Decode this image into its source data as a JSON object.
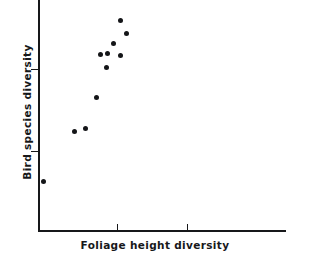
{
  "chart_data": {
    "type": "scatter",
    "title": "",
    "xlabel": "Foliage height diversity",
    "ylabel": "Bird species diversity",
    "grid": false,
    "legend": null,
    "xlim": [
      0,
      1
    ],
    "ylim": [
      0,
      1
    ],
    "axis_color": "#17181a",
    "point_color": "#141518",
    "x_tick_positions": [
      0.32,
      0.6
    ],
    "x_tick_labels": [
      "",
      ""
    ],
    "y_tick_positions": [
      0.345,
      0.7
    ],
    "y_tick_labels": [
      "",
      ""
    ],
    "points": [
      {
        "px": 120,
        "py": 20
      },
      {
        "px": 126,
        "py": 33
      },
      {
        "px": 113,
        "py": 43
      },
      {
        "px": 100,
        "py": 54
      },
      {
        "px": 107,
        "py": 53
      },
      {
        "px": 120,
        "py": 55
      },
      {
        "px": 106,
        "py": 67
      },
      {
        "px": 96,
        "py": 97
      },
      {
        "px": 74,
        "py": 131
      },
      {
        "px": 85,
        "py": 128
      },
      {
        "px": 43,
        "py": 181
      }
    ]
  }
}
